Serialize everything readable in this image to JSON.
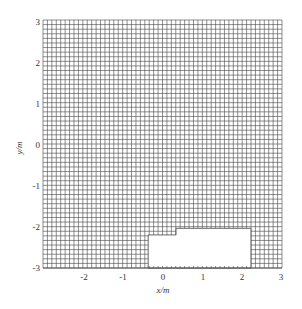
{
  "figure": {
    "type": "mesh-grid",
    "domain": {
      "xmin": -3,
      "xmax": 3,
      "ymin": -3,
      "ymax": 3
    },
    "cells_per_meter": 9,
    "grid_color": "#444444",
    "background_color": "#ffffff",
    "cutout": {
      "description": "Empty (unmeshed) region at bottom center",
      "polygon_m": [
        [
          -0.36,
          -3.0
        ],
        [
          -0.36,
          -2.2
        ],
        [
          0.34,
          -2.2
        ],
        [
          0.34,
          -2.04
        ],
        [
          2.22,
          -2.04
        ],
        [
          2.22,
          -3.0
        ]
      ]
    }
  },
  "axes": {
    "x": {
      "label": "x/m",
      "ticks": [
        "-2",
        "-1",
        "0",
        "1",
        "2",
        "3"
      ]
    },
    "y": {
      "label": "y/m",
      "ticks": [
        "3",
        "2",
        "1",
        "0",
        "-1",
        "-2",
        "-3"
      ]
    }
  }
}
